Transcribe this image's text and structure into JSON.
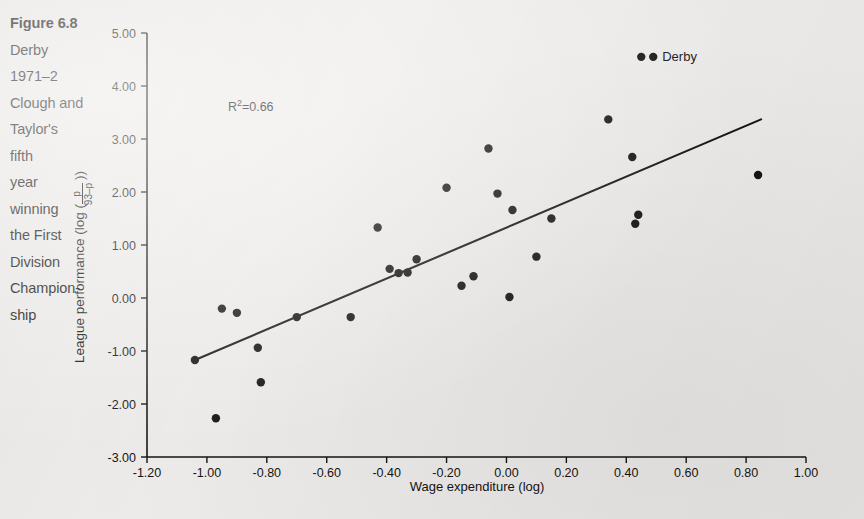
{
  "caption": {
    "lines": [
      "Figure 6.8",
      "Derby",
      "1971–2",
      "Clough and",
      "Taylor's",
      "fifth",
      "year",
      "winning",
      "the First",
      "Division",
      "Champion-",
      "ship"
    ],
    "bold_line_index": 0
  },
  "chart_data": {
    "type": "scatter",
    "title": "",
    "xlabel": "Wage expenditure (log)",
    "ylabel": "League performance (log ( p / (93–p) ))",
    "ylabel_prefix": "League performance (log (",
    "ylabel_numerator": "p",
    "ylabel_denominator": "93–p",
    "ylabel_suffix": "))",
    "xlim": [
      -1.2,
      1.0
    ],
    "ylim": [
      -3.0,
      5.0
    ],
    "xticks": [
      -1.2,
      -1.0,
      -0.8,
      -0.6,
      -0.4,
      -0.2,
      0.0,
      0.2,
      0.4,
      0.6,
      0.8,
      1.0
    ],
    "xtick_labels": [
      "-1.20",
      "-1.00",
      "-0.80",
      "-0.60",
      "-0.40",
      "-0.20",
      "0.00",
      "0.20",
      "0.40",
      "0.60",
      "0.80",
      "1.00"
    ],
    "yticks": [
      -3.0,
      -2.0,
      -1.0,
      0.0,
      1.0,
      2.0,
      3.0,
      4.0,
      5.0
    ],
    "ytick_labels": [
      "-3.00",
      "-2.00",
      "-1.00",
      "0.00",
      "1.00",
      "2.00",
      "3.00",
      "4.00",
      "5.00"
    ],
    "grid": false,
    "legend": "none",
    "annotations": [
      {
        "name": "r-squared",
        "text": "R²=0.66",
        "superscript_base": "R",
        "superscript": "2",
        "rest": "=0.66",
        "x": -0.93,
        "y": 3.52
      }
    ],
    "point_labels": [
      {
        "name": "derby-label",
        "text": "Derby",
        "x": 0.49,
        "y": 4.55
      }
    ],
    "trendline": {
      "name": "regression-line",
      "x_start": -1.04,
      "y_start": -1.17,
      "x_end": 0.85,
      "y_end": 3.37,
      "color": "#141414"
    },
    "marker_color": "#141414",
    "series": [
      {
        "name": "Clubs",
        "points": [
          {
            "x": -1.04,
            "y": -1.17
          },
          {
            "x": -0.97,
            "y": -2.27
          },
          {
            "x": -0.95,
            "y": -0.2
          },
          {
            "x": -0.9,
            "y": -0.28
          },
          {
            "x": -0.83,
            "y": -0.94
          },
          {
            "x": -0.82,
            "y": -1.59
          },
          {
            "x": -0.7,
            "y": -0.36
          },
          {
            "x": -0.52,
            "y": -0.36
          },
          {
            "x": -0.43,
            "y": 1.33
          },
          {
            "x": -0.39,
            "y": 0.55
          },
          {
            "x": -0.36,
            "y": 0.47
          },
          {
            "x": -0.33,
            "y": 0.48
          },
          {
            "x": -0.3,
            "y": 0.73
          },
          {
            "x": -0.2,
            "y": 2.08
          },
          {
            "x": -0.15,
            "y": 0.23
          },
          {
            "x": -0.11,
            "y": 0.41
          },
          {
            "x": -0.06,
            "y": 2.82
          },
          {
            "x": -0.03,
            "y": 1.97
          },
          {
            "x": 0.01,
            "y": 0.02
          },
          {
            "x": 0.02,
            "y": 1.66
          },
          {
            "x": 0.1,
            "y": 0.78
          },
          {
            "x": 0.15,
            "y": 1.5
          },
          {
            "x": 0.34,
            "y": 3.37
          },
          {
            "x": 0.42,
            "y": 2.66
          },
          {
            "x": 0.43,
            "y": 1.4
          },
          {
            "x": 0.44,
            "y": 1.57
          },
          {
            "x": 0.45,
            "y": 4.55
          },
          {
            "x": 0.84,
            "y": 2.32
          }
        ]
      }
    ]
  }
}
